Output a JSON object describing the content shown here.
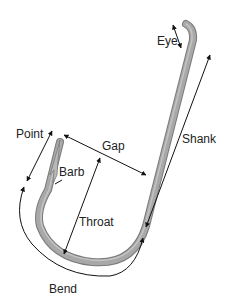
{
  "diagram": {
    "labels": {
      "eye": "Eye",
      "shank": "Shank",
      "gap": "Gap",
      "point": "Point",
      "barb": "Barb",
      "throat": "Throat",
      "bend": "Bend"
    },
    "colors": {
      "hook_fill": "#a8a8a8",
      "hook_edge": "#7a7a7a",
      "hook_highlight": "#d0d0d0",
      "arrow": "#111111",
      "text": "#222222"
    }
  }
}
